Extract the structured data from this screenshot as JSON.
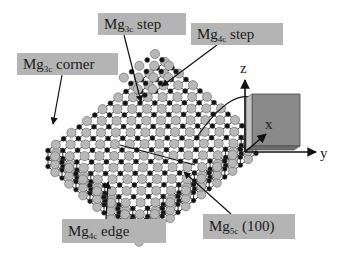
{
  "figure": {
    "type": "MgO crystal surface site diagram",
    "colors": {
      "background": "#ffffff",
      "label_box": "#b4b4b4",
      "mg_atom": "#b8b8b8",
      "o_atom": "#111111",
      "bond": "#222222",
      "cube_front": "#8a8a8a",
      "cube_side": "#c4c4c4",
      "arrow": "#111111"
    }
  },
  "labels": [
    {
      "id": "mg3c-step",
      "base": "Mg",
      "sub": "3c",
      "suffix": " step"
    },
    {
      "id": "mg4c-step",
      "base": "Mg",
      "sub": "4c",
      "suffix": " step"
    },
    {
      "id": "mg3c-corner",
      "base": "Mg",
      "sub": "3c",
      "suffix": " corner"
    },
    {
      "id": "mg4c-edge",
      "base": "Mg",
      "sub": "4c",
      "suffix": " edge"
    },
    {
      "id": "mg5c-100",
      "base": "Mg",
      "sub": "5c",
      "suffix": " (100)"
    }
  ],
  "axes": {
    "z": "z",
    "x": "x",
    "y": "y"
  }
}
